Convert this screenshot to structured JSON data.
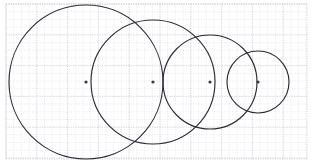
{
  "figure": {
    "width": 313,
    "height": 164,
    "background_color": "#ffffff"
  },
  "plot_area": {
    "x": 6,
    "y": 4,
    "width": 301,
    "height": 155,
    "border_color": "#c4c4d0",
    "border_style": "dotted"
  },
  "grid": {
    "visible": true,
    "style": "dotted",
    "minor_color": "#d8d8e0",
    "major_color": "#c8c8d4",
    "minor_spacing": 7.7,
    "major_spacing": 30.8,
    "origin_x": 6,
    "origin_y": 4
  },
  "chart_data": {
    "type": "scatter",
    "xlabel": "",
    "ylabel": "",
    "xlim": [
      0,
      313
    ],
    "ylim": [
      0,
      164
    ],
    "grid": true,
    "legend": "none",
    "circle_color": "#2b2b33",
    "center_marker_color": "#3a3a42",
    "circles": [
      {
        "label": "circle-1",
        "cx": 86,
        "cy": 82,
        "r": 77
      },
      {
        "label": "circle-2",
        "cx": 153,
        "cy": 82,
        "r": 62
      },
      {
        "label": "circle-3",
        "cx": 210,
        "cy": 82,
        "r": 47
      },
      {
        "label": "circle-4",
        "cx": 258,
        "cy": 82,
        "r": 31
      }
    ],
    "centers": [
      {
        "label": "center-1",
        "x": 86,
        "y": 82
      },
      {
        "label": "center-2",
        "x": 153,
        "y": 82
      },
      {
        "label": "center-3",
        "x": 210,
        "y": 82
      },
      {
        "label": "center-4",
        "x": 258,
        "y": 82
      }
    ],
    "center_marker_radius": 1.6
  }
}
